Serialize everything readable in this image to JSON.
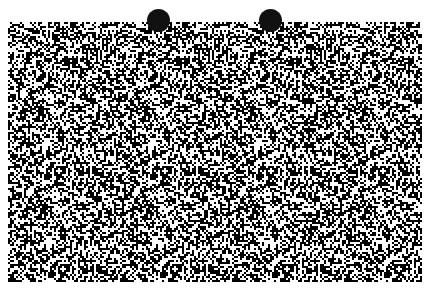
{
  "image": {
    "kind": "random-dot stereogram",
    "description": "Black and white random-dot noise pattern with two black fixation dots at top",
    "background_color": "#ffffff",
    "dot_color": "#111111",
    "noise_region": {
      "x": 8,
      "y": 22,
      "width": 414,
      "height": 260
    },
    "fixation_dots": [
      {
        "cx": 158,
        "cy": 20,
        "r": 11
      },
      {
        "cx": 270,
        "cy": 20,
        "r": 11
      }
    ],
    "pattern_period_px": 112
  }
}
